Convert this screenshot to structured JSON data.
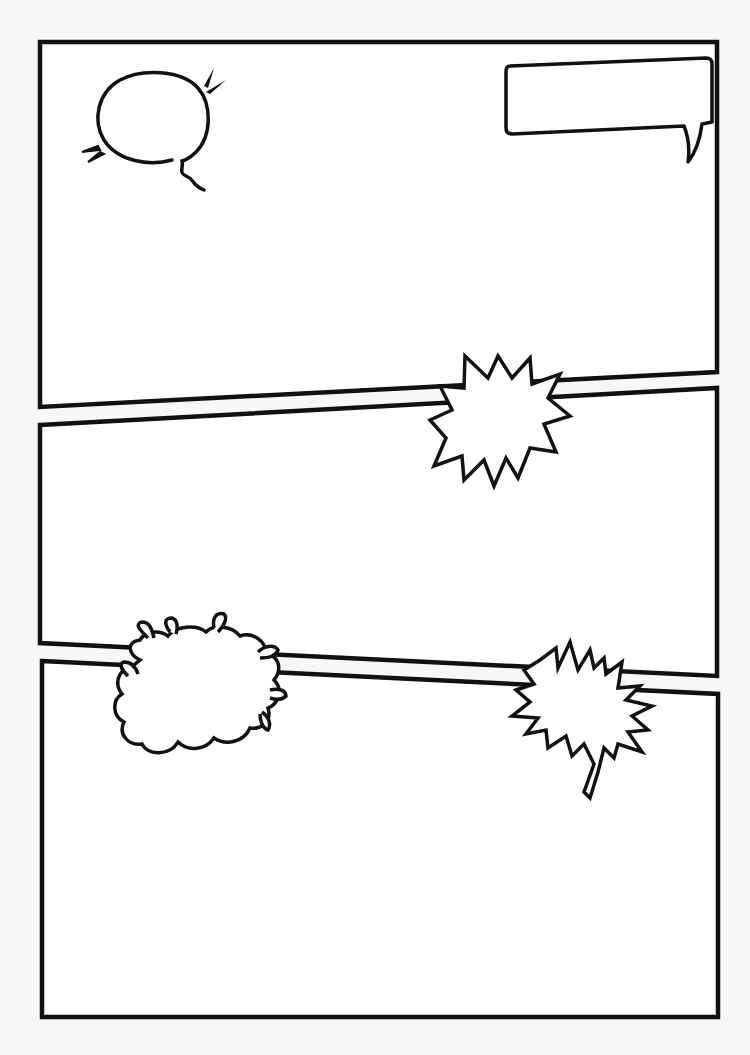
{
  "page": {
    "title": "Blank comic page template",
    "background": "#f7f7f7",
    "ink": "#111111",
    "paper": "#ffffff"
  },
  "panels": [
    {
      "id": "panel-1",
      "label": "Top panel",
      "points": "40,42 717,42 717,372 40,407"
    },
    {
      "id": "panel-2",
      "label": "Middle panel",
      "points": "40,425 717,388 717,676 40,643"
    },
    {
      "id": "panel-3",
      "label": "Bottom panel",
      "points": "42,661 718,694 718,1017 42,1017"
    }
  ],
  "balloons": [
    {
      "id": "oval-thought-balloon",
      "type": "oval speech balloon with curly tail",
      "text": ""
    },
    {
      "id": "rect-caption-balloon",
      "type": "rectangular speech balloon with tail",
      "text": ""
    },
    {
      "id": "starburst-balloon-1",
      "type": "spiky starburst",
      "text": ""
    },
    {
      "id": "cloud-splash-balloon",
      "type": "cloud burst with droplets",
      "text": ""
    },
    {
      "id": "jagged-shout-balloon",
      "type": "jagged shout balloon with tail",
      "text": ""
    }
  ]
}
